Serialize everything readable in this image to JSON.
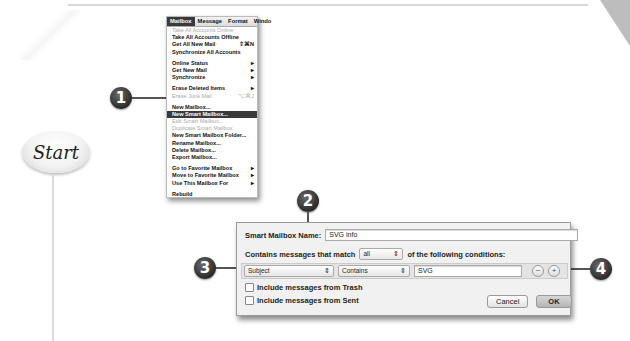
{
  "decor": {
    "start_label": "Start"
  },
  "steps": [
    "1",
    "2",
    "3",
    "4"
  ],
  "menu": {
    "bar": [
      "Mailbox",
      "Message",
      "Format",
      "Windo"
    ],
    "active_bar_index": 0,
    "items": [
      {
        "label": "Take All Accounts Online",
        "shortcut": "",
        "disabled": true
      },
      {
        "label": "Take All Accounts Offline",
        "shortcut": ""
      },
      {
        "label": "Get All New Mail",
        "shortcut": "⇧⌘N"
      },
      {
        "label": "Synchronize All Accounts",
        "shortcut": ""
      },
      {
        "sep": true
      },
      {
        "label": "Online Status",
        "shortcut": "▸"
      },
      {
        "label": "Get New Mail",
        "shortcut": "▸"
      },
      {
        "label": "Synchronize",
        "shortcut": "▸"
      },
      {
        "sep": true
      },
      {
        "label": "Erase Deleted Items",
        "shortcut": "▸"
      },
      {
        "label": "Erase Junk Mail",
        "shortcut": "⌥⌘J",
        "disabled": true
      },
      {
        "sep": true
      },
      {
        "label": "New Mailbox...",
        "shortcut": ""
      },
      {
        "label": "New Smart Mailbox...",
        "shortcut": "",
        "selected": true
      },
      {
        "label": "Edit Smart Mailbox...",
        "shortcut": "",
        "disabled": true
      },
      {
        "label": "Duplicate Smart Mailbox",
        "shortcut": "",
        "disabled": true
      },
      {
        "label": "New Smart Mailbox Folder...",
        "shortcut": ""
      },
      {
        "label": "Rename Mailbox...",
        "shortcut": ""
      },
      {
        "label": "Delete Mailbox...",
        "shortcut": ""
      },
      {
        "label": "Export Mailbox...",
        "shortcut": ""
      },
      {
        "sep": true
      },
      {
        "label": "Go to Favorite Mailbox",
        "shortcut": "▸"
      },
      {
        "label": "Move to Favorite Mailbox",
        "shortcut": "▸"
      },
      {
        "label": "Use This Mailbox For",
        "shortcut": "▸"
      },
      {
        "sep": true
      },
      {
        "label": "Rebuild",
        "shortcut": ""
      }
    ]
  },
  "dialog": {
    "name_label": "Smart Mailbox Name:",
    "name_value": "SVG info",
    "match_prefix": "Contains messages that match",
    "match_value": "all",
    "match_suffix": "of the following conditions:",
    "condition": {
      "field": "Subject",
      "operator": "Contains",
      "value": "SVG"
    },
    "remove_label": "−",
    "add_label": "+",
    "include_trash": "Include messages from Trash",
    "include_sent": "Include messages from Sent",
    "cancel": "Cancel",
    "ok": "OK"
  }
}
